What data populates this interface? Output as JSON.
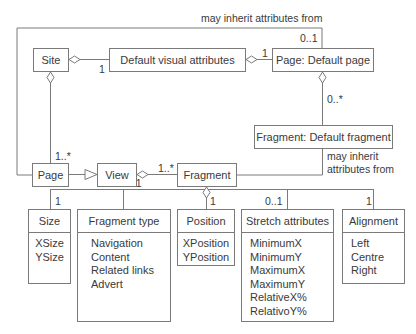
{
  "diagram": {
    "inherit_top_label": "may inherit attributes from",
    "inherit_side_label_line1": "may inherit",
    "inherit_side_label_line2": "attributes from",
    "nodes": {
      "site": "Site",
      "default_visual_attributes": "Default visual attributes",
      "page_default_page": "Page: Default page",
      "fragment_default_fragment": "Fragment: Default fragment",
      "page": "Page",
      "view": "View",
      "fragment": "Fragment"
    },
    "multiplicities": {
      "site_dva": "1",
      "dva_pagedefault": "1",
      "inherit_page_default": "0..1",
      "pagedefault_fragdefault": "0..*",
      "site_page": "1..*",
      "view_fragment": "1..*",
      "fragment_type": "0..1",
      "size": "1",
      "position": "1",
      "stretch": "0..1",
      "alignment": "1"
    },
    "classes": [
      {
        "name": "Size",
        "attrs": [
          "XSize",
          "YSize"
        ]
      },
      {
        "name": "Fragment type",
        "attrs": [
          "Navigation",
          "Content",
          "Related links",
          "Advert"
        ]
      },
      {
        "name": "Position",
        "attrs": [
          "XPosition",
          "YPosition"
        ]
      },
      {
        "name": "Stretch attributes",
        "attrs": [
          "MinimumX",
          "MinimumY",
          "MaximumX",
          "MaximumY",
          "RelativeX%",
          "RelativoY%"
        ]
      },
      {
        "name": "Alignment",
        "attrs": [
          "Left",
          "Centre",
          "Right"
        ]
      }
    ]
  }
}
